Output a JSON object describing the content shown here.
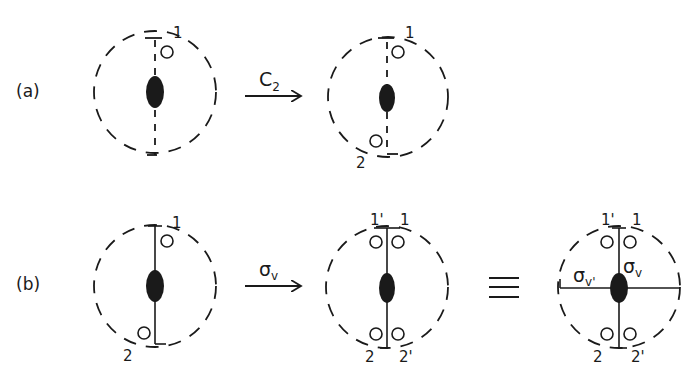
{
  "figure": {
    "rows": [
      {
        "label": "(a)",
        "operation": {
          "symbol": "C",
          "subscript": "2"
        },
        "before": {
          "labels": [
            "1"
          ]
        },
        "after": {
          "labels": [
            "1",
            "2"
          ]
        }
      },
      {
        "label": "(b)",
        "operation": {
          "symbol": "σ",
          "subscript": "v"
        },
        "before": {
          "labels": [
            "1",
            "2"
          ]
        },
        "after": {
          "labels": [
            "1'",
            "1",
            "2",
            "2'"
          ]
        },
        "equivalence": {
          "symbol": "≡"
        },
        "equivalent": {
          "labels": [
            "1'",
            "1",
            "2",
            "2'"
          ],
          "planes": [
            {
              "symbol": "σ",
              "subscript": "v"
            },
            {
              "symbol": "σ",
              "subscript": "v'"
            }
          ]
        }
      }
    ]
  }
}
